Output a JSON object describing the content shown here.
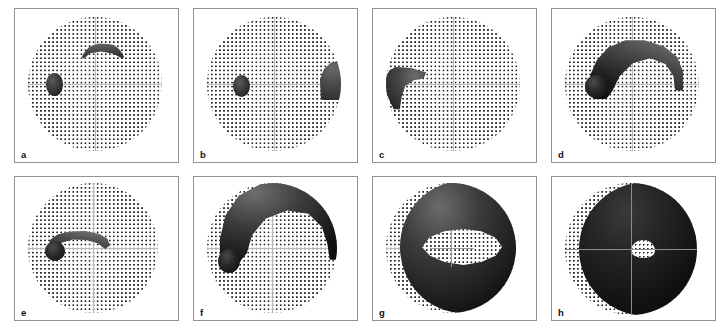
{
  "figure": {
    "kind": "visual-field-perimetry-panel-series",
    "panel_count": 8,
    "rows": 2,
    "columns": 4,
    "background_color": "#ffffff",
    "panel_border_color": "#8f9296",
    "dot_color": "#1b1b1b",
    "crosshair_color": "#b9babd",
    "defect_color": "#141414"
  },
  "panels": [
    {
      "label": "a",
      "field": {
        "shape": "circle",
        "grid": "square-dot-array",
        "crosshair": true
      },
      "defects": [
        {
          "name": "paracentral-oval-scotoma",
          "position": "left-of-fixation",
          "form": "oval"
        },
        {
          "name": "superior-arcuate-band",
          "position": "above-fixation",
          "form": "shallow-arc"
        }
      ]
    },
    {
      "label": "b",
      "field": {
        "shape": "circle",
        "grid": "square-dot-array",
        "crosshair": true
      },
      "defects": [
        {
          "name": "paracentral-oval-scotoma",
          "position": "left-of-fixation",
          "form": "oval"
        },
        {
          "name": "temporal-wedge-defect",
          "position": "right-periphery",
          "form": "wedge-blob"
        }
      ]
    },
    {
      "label": "c",
      "field": {
        "shape": "circle",
        "grid": "square-dot-array",
        "crosshair": true
      },
      "defects": [
        {
          "name": "nasal-step-defect",
          "position": "left-periphery",
          "form": "axe-head"
        }
      ]
    },
    {
      "label": "d",
      "field": {
        "shape": "circle",
        "grid": "square-dot-array",
        "crosshair": true
      },
      "defects": [
        {
          "name": "superior-arcuate-scotoma",
          "position": "upper-hemifield-arc",
          "form": "broad-arc-with-knob"
        }
      ]
    },
    {
      "label": "e",
      "field": {
        "shape": "circle",
        "grid": "square-dot-array",
        "crosshair": true
      },
      "defects": [
        {
          "name": "narrow-arcuate-scotoma",
          "position": "just-above-fixation",
          "form": "comma-arc"
        }
      ]
    },
    {
      "label": "f",
      "field": {
        "shape": "circle",
        "grid": "square-dot-array",
        "crosshair": true
      },
      "defects": [
        {
          "name": "superior-hemifield-loss",
          "position": "upper-half",
          "form": "cap-with-central-notch"
        }
      ]
    },
    {
      "label": "g",
      "field": {
        "shape": "circle",
        "grid": "square-dot-array",
        "crosshair": true
      },
      "defects": [
        {
          "name": "double-arcuate-ring-scotoma",
          "position": "encircling-fixation",
          "form": "ring-with-lens-shaped-spared-band"
        }
      ]
    },
    {
      "label": "h",
      "field": {
        "shape": "circle",
        "grid": "square-dot-array",
        "crosshair": true
      },
      "defects": [
        {
          "name": "end-stage-field-loss",
          "position": "entire-field",
          "form": "total-loss-with-small-central-island"
        },
        {
          "name": "spared-central-island",
          "position": "at-fixation",
          "form": "small-patch"
        },
        {
          "name": "spared-temporal-crescent",
          "position": "far-left-edge",
          "form": "narrow-strip"
        }
      ]
    }
  ]
}
